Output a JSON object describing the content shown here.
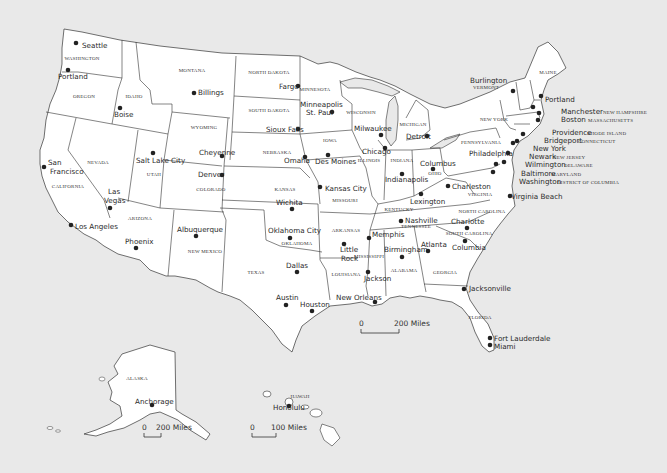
{
  "map": {
    "title": "United States",
    "background_color": "#e9e9e9",
    "land_color": "#ffffff",
    "border_color": "#333333"
  },
  "states": [
    {
      "name": "WASHINGTON",
      "x": 82,
      "y": 60
    },
    {
      "name": "OREGON",
      "x": 84,
      "y": 98
    },
    {
      "name": "IDAHO",
      "x": 134,
      "y": 98
    },
    {
      "name": "MONTANA",
      "x": 192,
      "y": 72
    },
    {
      "name": "WYOMING",
      "x": 204,
      "y": 129
    },
    {
      "name": "NEVADA",
      "x": 98,
      "y": 164
    },
    {
      "name": "UTAH",
      "x": 154,
      "y": 176
    },
    {
      "name": "COLORADO",
      "x": 211,
      "y": 191
    },
    {
      "name": "CALIFORNIA",
      "x": 68,
      "y": 188
    },
    {
      "name": "ARIZONA",
      "x": 140,
      "y": 220
    },
    {
      "name": "NEW MEXICO",
      "x": 205,
      "y": 253
    },
    {
      "name": "NORTH DAKOTA",
      "x": 269,
      "y": 74
    },
    {
      "name": "SOUTH DAKOTA",
      "x": 269,
      "y": 112
    },
    {
      "name": "NEBRASKA",
      "x": 277,
      "y": 154
    },
    {
      "name": "KANSAS",
      "x": 285,
      "y": 191
    },
    {
      "name": "OKLAHOMA",
      "x": 297,
      "y": 245
    },
    {
      "name": "TEXAS",
      "x": 256,
      "y": 274
    },
    {
      "name": "MINNESOTA",
      "x": 315,
      "y": 91
    },
    {
      "name": "IOWA",
      "x": 330,
      "y": 142
    },
    {
      "name": "MISSOURI",
      "x": 345,
      "y": 202
    },
    {
      "name": "ARKANSAS",
      "x": 346,
      "y": 232
    },
    {
      "name": "LOUISIANA",
      "x": 346,
      "y": 276
    },
    {
      "name": "WISCONSIN",
      "x": 361,
      "y": 114
    },
    {
      "name": "ILLINOIS",
      "x": 369,
      "y": 162
    },
    {
      "name": "MICHIGAN",
      "x": 413,
      "y": 126
    },
    {
      "name": "INDIANA",
      "x": 402,
      "y": 162
    },
    {
      "name": "OHIO",
      "x": 435,
      "y": 175
    },
    {
      "name": "KENTUCKY",
      "x": 399,
      "y": 211
    },
    {
      "name": "TENNESSEE",
      "x": 416,
      "y": 228
    },
    {
      "name": "MISSISSIPPI",
      "x": 369,
      "y": 258
    },
    {
      "name": "ALABAMA",
      "x": 404,
      "y": 272
    },
    {
      "name": "GEORGIA",
      "x": 445,
      "y": 274
    },
    {
      "name": "FLORIDA",
      "x": 480,
      "y": 319
    },
    {
      "name": "SOUTH CAROLINA",
      "x": 469,
      "y": 235
    },
    {
      "name": "NORTH CAROLINA",
      "x": 482,
      "y": 213
    },
    {
      "name": "VIRGINIA",
      "x": 480,
      "y": 196
    },
    {
      "name": "PENNSYLVANIA",
      "x": 481,
      "y": 144
    },
    {
      "name": "NEW YORK",
      "x": 494,
      "y": 121
    },
    {
      "name": "MAINE",
      "x": 548,
      "y": 74
    },
    {
      "name": "ALASKA",
      "x": 137,
      "y": 380
    },
    {
      "name": "HAWAII",
      "x": 300,
      "y": 398
    }
  ],
  "cities": [
    {
      "name": "Seattle",
      "dot": [
        76,
        43
      ],
      "x": 82,
      "y": 48
    },
    {
      "name": "Portland",
      "dot": [
        68,
        70
      ],
      "x": 58,
      "y": 79
    },
    {
      "name": "Boise",
      "dot": [
        120,
        108
      ],
      "x": 114,
      "y": 117
    },
    {
      "name": "Billings",
      "dot": [
        194,
        93
      ],
      "x": 198,
      "y": 95
    },
    {
      "name": "Cheyenne",
      "dot": [
        222,
        156
      ],
      "x": 199,
      "y": 155
    },
    {
      "name": "Salt Lake City",
      "dot": [
        153,
        153
      ],
      "x": 136,
      "y": 163
    },
    {
      "name": "Denver",
      "dot": [
        222,
        175
      ],
      "x": 198,
      "y": 177
    },
    {
      "name": "San Francisco",
      "dot": [
        44,
        167
      ],
      "x": 48,
      "y": 165
    },
    {
      "name": "Francisco",
      "dot": null,
      "x": 50,
      "y": 174
    },
    {
      "name": "Las",
      "dot": null,
      "x": 108,
      "y": 194
    },
    {
      "name": "Vegas",
      "dot": [
        110,
        208
      ],
      "x": 104,
      "y": 203
    },
    {
      "name": "Los Angeles",
      "dot": [
        71,
        225
      ],
      "x": 75,
      "y": 229
    },
    {
      "name": "Phoenix",
      "dot": [
        136,
        248
      ],
      "x": 125,
      "y": 244
    },
    {
      "name": "Albuquerque",
      "dot": [
        196,
        236
      ],
      "x": 177,
      "y": 232
    },
    {
      "name": "Fargo",
      "dot": [
        298,
        86
      ],
      "x": 279,
      "y": 89
    },
    {
      "name": "Minneapolis",
      "dot": null,
      "x": 300,
      "y": 107
    },
    {
      "name": "St. Paul",
      "dot": [
        332,
        112
      ],
      "x": 306,
      "y": 115
    },
    {
      "name": "Sioux Falls",
      "dot": [
        298,
        129
      ],
      "x": 266,
      "y": 132
    },
    {
      "name": "Omaha",
      "dot": [
        305,
        157
      ],
      "x": 284,
      "y": 163
    },
    {
      "name": "Des Moines",
      "dot": [
        328,
        155
      ],
      "x": 315,
      "y": 164
    },
    {
      "name": "Kansas City",
      "dot": [
        320,
        187
      ],
      "x": 325,
      "y": 191
    },
    {
      "name": "Wichita",
      "dot": [
        292,
        209
      ],
      "x": 276,
      "y": 205
    },
    {
      "name": "Oklahoma City",
      "dot": [
        290,
        238
      ],
      "x": 268,
      "y": 233
    },
    {
      "name": "Dallas",
      "dot": [
        297,
        272
      ],
      "x": 286,
      "y": 268
    },
    {
      "name": "Austin",
      "dot": [
        286,
        305
      ],
      "x": 276,
      "y": 300
    },
    {
      "name": "Houston",
      "dot": [
        312,
        311
      ],
      "x": 300,
      "y": 307
    },
    {
      "name": "Little",
      "dot": [
        344,
        244
      ],
      "x": 340,
      "y": 252
    },
    {
      "name": "Rock",
      "dot": null,
      "x": 341,
      "y": 261
    },
    {
      "name": "Memphis",
      "dot": [
        369,
        238
      ],
      "x": 372,
      "y": 237
    },
    {
      "name": "Jackson",
      "dot": [
        368,
        272
      ],
      "x": 364,
      "y": 281
    },
    {
      "name": "New Orleans",
      "dot": [
        375,
        302
      ],
      "x": 336,
      "y": 300
    },
    {
      "name": "Birmingham",
      "dot": [
        402,
        257
      ],
      "x": 384,
      "y": 252
    },
    {
      "name": "Atlanta",
      "dot": [
        428,
        251
      ],
      "x": 421,
      "y": 247
    },
    {
      "name": "Milwaukee",
      "dot": [
        381,
        135
      ],
      "x": 354,
      "y": 131
    },
    {
      "name": "Chicago",
      "dot": [
        385,
        148
      ],
      "x": 362,
      "y": 154
    },
    {
      "name": "Detroit",
      "dot": [
        427,
        136
      ],
      "x": 406,
      "y": 139
    },
    {
      "name": "Indianapolis",
      "dot": [
        402,
        174
      ],
      "x": 385,
      "y": 182
    },
    {
      "name": "Columbus",
      "dot": [
        433,
        169
      ],
      "x": 420,
      "y": 166
    },
    {
      "name": "Lexington",
      "dot": [
        421,
        194
      ],
      "x": 410,
      "y": 204
    },
    {
      "name": "Nashville",
      "dot": [
        401,
        221
      ],
      "x": 405,
      "y": 223
    },
    {
      "name": "Charleston",
      "dot": [
        448,
        186
      ],
      "x": 452,
      "y": 189
    },
    {
      "name": "Charlotte",
      "dot": [
        467,
        228
      ],
      "x": 451,
      "y": 224
    },
    {
      "name": "Columbia",
      "dot": [
        465,
        241
      ],
      "x": 452,
      "y": 250
    },
    {
      "name": "Jacksonville",
      "dot": [
        464,
        289
      ],
      "x": 469,
      "y": 291
    },
    {
      "name": "Fort Lauderdale",
      "dot": [
        490,
        338
      ],
      "x": 494,
      "y": 341
    },
    {
      "name": "Miami",
      "dot": [
        490,
        345
      ],
      "x": 494,
      "y": 349
    },
    {
      "name": "Virginia Beach",
      "dot": [
        510,
        196
      ],
      "x": 511,
      "y": 199
    },
    {
      "name": "Philadelphia",
      "dot": [
        508,
        153
      ],
      "x": 469,
      "y": 156
    },
    {
      "name": "Burlington",
      "dot": [
        513,
        91
      ],
      "x": 470,
      "y": 83
    },
    {
      "name": "Portland",
      "dot": [
        541,
        96
      ],
      "x": 545,
      "y": 102
    },
    {
      "name": "Manchester",
      "dot": [
        533,
        107
      ],
      "x": 561,
      "y": 114
    },
    {
      "name": "Boston",
      "dot": [
        539,
        113
      ],
      "x": 561,
      "y": 122
    },
    {
      "name": "Providence",
      "dot": [
        538,
        120
      ],
      "x": 552,
      "y": 135
    },
    {
      "name": "Bridgeport",
      "dot": [
        523,
        134
      ],
      "x": 544,
      "y": 143
    },
    {
      "name": "New York",
      "dot": [
        517,
        141
      ],
      "x": 533,
      "y": 151
    },
    {
      "name": "Newark",
      "dot": [
        513,
        143
      ],
      "x": 529,
      "y": 159
    },
    {
      "name": "Wilmington",
      "dot": [
        504,
        162
      ],
      "x": 525,
      "y": 167
    },
    {
      "name": "Baltimore",
      "dot": [
        496,
        164
      ],
      "x": 521,
      "y": 176
    },
    {
      "name": "Washington",
      "dot": [
        493,
        172
      ],
      "x": 519,
      "y": 184
    },
    {
      "name": "Anchorage",
      "dot": [
        152,
        405
      ],
      "x": 135,
      "y": 404
    },
    {
      "name": "Honolulu",
      "dot": [
        289,
        406
      ],
      "x": 273,
      "y": 410
    }
  ],
  "state_abbrev_tags": [
    {
      "name": "VERMONT",
      "x": 473,
      "y": 89
    },
    {
      "name": "NEW HAMPSHIRE",
      "x": 603,
      "y": 114
    },
    {
      "name": "MASSACHUSETTS",
      "x": 588,
      "y": 122
    },
    {
      "name": "RHODE ISLAND",
      "x": 587,
      "y": 135
    },
    {
      "name": "CONNECTICUT",
      "x": 578,
      "y": 143
    },
    {
      "name": "NEW JERSEY",
      "x": 553,
      "y": 159
    },
    {
      "name": "DELAWARE",
      "x": 564,
      "y": 167
    },
    {
      "name": "MARYLAND",
      "x": 551,
      "y": 176
    },
    {
      "name": "DISTRICT OF COLUMBIA",
      "x": 557,
      "y": 184
    }
  ],
  "scale_bars": [
    {
      "id": "contiguous",
      "start_label": "0",
      "end_label": "200 Miles",
      "x": 361,
      "y": 333,
      "width": 38
    },
    {
      "id": "alaska",
      "start_label": "0",
      "end_label": "200 Miles",
      "x": 144,
      "y": 437,
      "width": 17
    },
    {
      "id": "hawaii",
      "start_label": "0",
      "end_label": "100 Miles",
      "x": 252,
      "y": 437,
      "width": 24
    }
  ]
}
